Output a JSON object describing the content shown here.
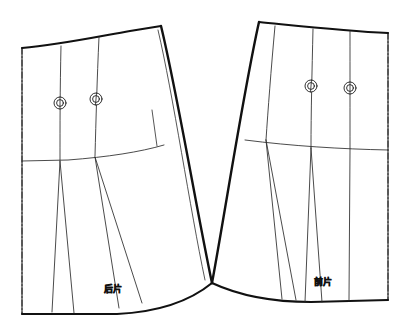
{
  "document": {
    "title": "裙片结构制图",
    "kind": "sewing-pattern-draft",
    "background_color": "#ffffff",
    "ink_color": "#111111",
    "thin_ink_color": "#2b2b2b",
    "canvas": {
      "width": 407,
      "height": 335
    }
  },
  "labels": {
    "back_piece": "后片",
    "front_piece": "前片"
  },
  "pieces": [
    {
      "id": "back",
      "name": "后片",
      "label": "后片",
      "label_x": 113,
      "label_y": 290,
      "center_fold_side": "left",
      "notch_count": 2
    },
    {
      "id": "front",
      "name": "前片",
      "label": "前片",
      "label_x": 323,
      "label_y": 283,
      "center_fold_side": "right",
      "notch_count": 2
    }
  ],
  "center_fold_lines": [
    {
      "name": "back-center-fold",
      "x": 22,
      "y1": 48,
      "y2": 314,
      "style": "dash-dot"
    },
    {
      "name": "front-center-fold",
      "x": 388,
      "y1": 33,
      "y2": 300,
      "style": "dash-dot"
    }
  ],
  "notch_markers": [
    {
      "piece": "back",
      "index": 1,
      "cx": 60,
      "cy": 103,
      "r_outer": 6,
      "r_inner": 3.4
    },
    {
      "piece": "back",
      "index": 2,
      "cx": 96,
      "cy": 99,
      "r_outer": 6,
      "r_inner": 3.4
    },
    {
      "piece": "front",
      "index": 1,
      "cx": 311,
      "cy": 86,
      "r_outer": 6,
      "r_inner": 3.4
    },
    {
      "piece": "front",
      "index": 2,
      "cx": 350,
      "cy": 88,
      "r_outer": 6,
      "r_inner": 3.4
    }
  ],
  "outline_paths": {
    "back_waist": "M22,48 C60,44 98,36 131,31 L160,26",
    "back_side_seam": "M160,26 C176,90 196,210 212,283",
    "back_hem": "M22,314 L118,314 C160,312 190,300 212,283",
    "back_center": "M22,48 L22,314",
    "front_waist": "M259,22 C300,26 345,31 388,33",
    "front_side_seam": "M259,22 C242,92 224,212 212,283",
    "front_hem": "M212,283 C240,296 276,302 310,302 L388,300",
    "front_center": "M388,33 L388,300"
  },
  "hip_lines": [
    {
      "name": "back-hip-line",
      "path": "M22,161 L70,160 C110,157 140,152 163,146"
    },
    {
      "name": "front-hip-line",
      "path": "M244,140 C290,146 340,149 388,150"
    }
  ],
  "seam_lines": [
    {
      "name": "back-seam-1",
      "path": "M61,46 C60,90 60,120 60,160"
    },
    {
      "name": "back-seam-1-lower-a",
      "path": "M60,161 L52,312"
    },
    {
      "name": "back-seam-1-lower-b",
      "path": "M60,161 L74,313"
    },
    {
      "name": "back-seam-2",
      "path": "M99,37 C97,80 96,120 95,156"
    },
    {
      "name": "back-seam-2-lower-a",
      "path": "M95,157 L120,308"
    },
    {
      "name": "back-seam-2-lower-b",
      "path": "M95,157 L142,303"
    },
    {
      "name": "back-inner-side",
      "path": "M158,30 C172,92 189,208 204,280"
    },
    {
      "name": "back-side-wedge",
      "path": "M154,118 L156,145"
    },
    {
      "name": "front-seam-1",
      "path": "M275,26 C271,70 268,110 265,140"
    },
    {
      "name": "front-seam-1-lower-a",
      "path": "M265,140 L283,299"
    },
    {
      "name": "front-seam-1-lower-b",
      "path": "M265,140 L296,300"
    },
    {
      "name": "front-seam-2",
      "path": "M312,29 C312,70 311,112 311,148"
    },
    {
      "name": "front-seam-2-lower-a",
      "path": "M311,148 L306,302"
    },
    {
      "name": "front-seam-2-lower-b",
      "path": "M311,148 L322,302"
    },
    {
      "name": "front-seam-3",
      "path": "M350,31 C350,70 350,112 350,150"
    },
    {
      "name": "front-seam-3-lower",
      "path": "M350,150 L349,301"
    }
  ]
}
